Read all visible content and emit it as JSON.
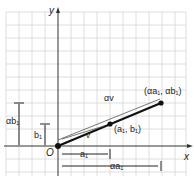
{
  "figure": {
    "axes": {
      "x_label": "x",
      "y_label": "y",
      "origin_label": "O"
    },
    "vectors": [
      {
        "name": "v",
        "label": "v",
        "end_label": "(a₁, b₁)"
      },
      {
        "name": "alpha-v",
        "label": "αv",
        "end_label": "(αa₁, αb₁)"
      }
    ],
    "dimensions": {
      "b1": "b₁",
      "alpha_b1": "αb₁",
      "a1": "a₁",
      "alpha_a1": "αa₁"
    },
    "colors": {
      "grid": "#d4d4d4",
      "axis": "#333333",
      "vector": "#111111"
    }
  }
}
